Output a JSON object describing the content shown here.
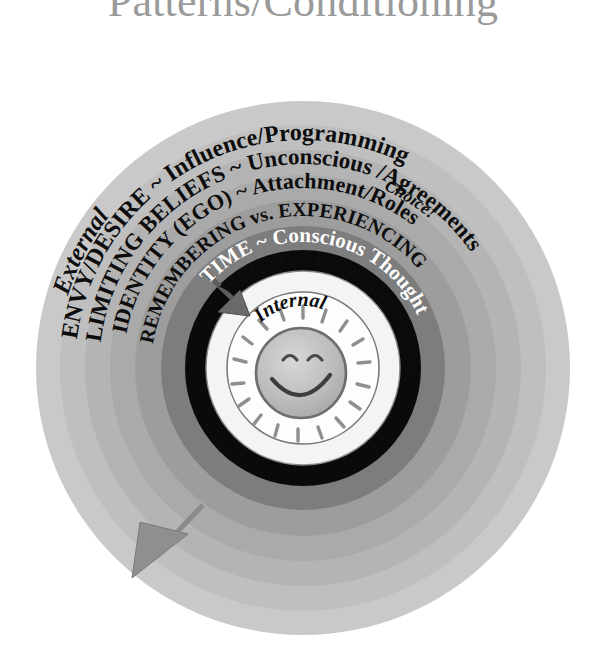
{
  "title": "Patterns/Conditioning",
  "diagram": {
    "name": "concentric-rings-internal-external",
    "center_label": "Internal",
    "center_icon": "smiling-sun-face-icon",
    "outer_label": "External",
    "choice_label": "Choice!",
    "rings": [
      {
        "id": "ring-envy-desire",
        "label": "ENVY/DESIRE ~ Influence/Programming",
        "color": "#b9b9b9",
        "text_color": "#0d0d0d"
      },
      {
        "id": "ring-limiting-beliefs",
        "label": "LIMITING BELIEFS ~ Unconscious /Agreements",
        "color": "#aaaaaa",
        "text_color": "#0d0d0d"
      },
      {
        "id": "ring-identity-ego",
        "label": "IDENTITY (EGO) ~ Attachment/Roles",
        "color": "#9a9a9a",
        "text_color": "#0d0d0d"
      },
      {
        "id": "ring-remembering-experiencing",
        "label": "REMEMBERING vs. EXPERIENCING",
        "color": "#7d7d7d",
        "text_color": "#0d0d0d"
      },
      {
        "id": "ring-time-conscious-thought",
        "label": "TIME ~ Conscious Thought",
        "color": "#0a0a0a",
        "text_color": "#ffffff"
      },
      {
        "id": "ring-wiring-unconscious",
        "label": "WIRING ~ Unconscious / Automatic",
        "color": "#f2f2f2",
        "text_color": "#0d0d0d"
      }
    ],
    "arrows": [
      {
        "id": "arrow-inward-experiencing",
        "direction": "inward",
        "color": "#6e6e6e"
      },
      {
        "id": "arrow-outward-choice",
        "direction": "outward",
        "color": "#8a8a8a"
      }
    ],
    "palette": {
      "background": "#ffffff",
      "halo_outer": "#c9c9c9",
      "halo_mid": "#bdbdbd",
      "halo_inner": "#b0b0b0",
      "black_ring": "#0a0a0a",
      "core_white": "#fdfdfd",
      "sun_face": "#b4b4b4",
      "title_color": "#9a9a9a"
    }
  }
}
